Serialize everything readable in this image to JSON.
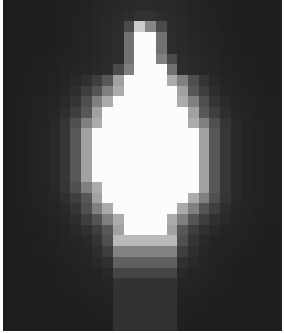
{
  "image": {
    "description": "Pixelated grayscale image of a bright teardrop-shaped blob on a dark background",
    "background_color": "#1c1c1c",
    "border_color": "#ffffff",
    "grid": {
      "cols": 26,
      "rows": 31,
      "cell_size_px": 10.7,
      "origin_x": 4,
      "origin_y": 5
    },
    "bright_rows": [
      {
        "row": 2,
        "cells": [
          [
            12,
            205
          ],
          [
            13,
            135
          ]
        ]
      },
      {
        "row": 3,
        "spans": [
          [
            12,
            13
          ]
        ]
      },
      {
        "row": 4,
        "spans": [
          [
            12,
            13
          ]
        ]
      },
      {
        "row": 5,
        "spans": [
          [
            12,
            13
          ]
        ]
      },
      {
        "row": 6,
        "spans": [
          [
            12,
            14
          ]
        ]
      },
      {
        "row": 7,
        "spans": [
          [
            11,
            14
          ]
        ]
      },
      {
        "row": 8,
        "spans": [
          [
            11,
            15
          ]
        ]
      },
      {
        "row": 9,
        "spans": [
          [
            10,
            15
          ]
        ]
      },
      {
        "row": 10,
        "spans": [
          [
            9,
            16
          ]
        ]
      },
      {
        "row": 11,
        "spans": [
          [
            9,
            16
          ]
        ]
      },
      {
        "row": 12,
        "spans": [
          [
            8,
            17
          ]
        ]
      },
      {
        "row": 13,
        "spans": [
          [
            8,
            17
          ]
        ]
      },
      {
        "row": 14,
        "spans": [
          [
            8,
            17
          ]
        ]
      },
      {
        "row": 15,
        "spans": [
          [
            8,
            17
          ]
        ]
      },
      {
        "row": 16,
        "spans": [
          [
            8,
            17
          ]
        ]
      },
      {
        "row": 17,
        "spans": [
          [
            9,
            17
          ]
        ]
      },
      {
        "row": 18,
        "spans": [
          [
            9,
            16
          ]
        ]
      },
      {
        "row": 19,
        "spans": [
          [
            10,
            15
          ]
        ]
      },
      {
        "row": 20,
        "spans": [
          [
            11,
            14
          ]
        ]
      },
      {
        "row": 21,
        "spans": [
          [
            11,
            14
          ]
        ]
      }
    ]
  }
}
